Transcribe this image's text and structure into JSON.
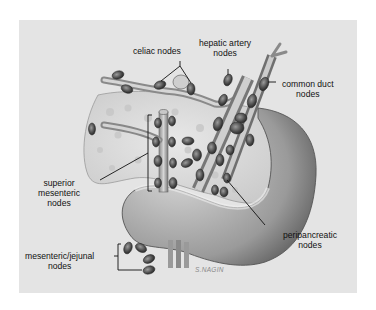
{
  "figure": {
    "background_color": "#e4e4e4",
    "labels": {
      "celiac": "celiac nodes",
      "hepatic_line1": "hepatic artery",
      "hepatic_line2": "nodes",
      "common_duct_line1": "common duct",
      "common_duct_line2": "nodes",
      "superior_line1": "superior",
      "superior_line2": "mesenteric",
      "superior_line3": "nodes",
      "peripancreatic_line1": "peripancreatic",
      "peripancreatic_line2": "nodes",
      "jejunal_line1": "mesenteric/jejunal",
      "jejunal_line2": "nodes"
    },
    "signature": "S.NAGIN"
  }
}
